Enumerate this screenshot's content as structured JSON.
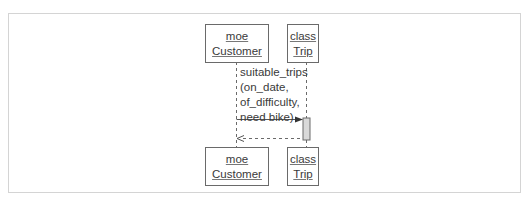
{
  "diagram": {
    "type": "sequence",
    "participants": [
      {
        "id": "customer",
        "instance": "moe",
        "class": "Customer"
      },
      {
        "id": "trip",
        "instance": "class",
        "class": "Trip"
      }
    ],
    "messages": [
      {
        "from": "customer",
        "to": "trip",
        "kind": "call",
        "label_lines": [
          "suitable_trips",
          "(on_date,",
          "of_difficulty,",
          "need bike)"
        ]
      },
      {
        "from": "trip",
        "to": "customer",
        "kind": "return",
        "label_lines": []
      }
    ],
    "colors": {
      "line": "#6a6a6a",
      "activation_fill": "#d9d9d9",
      "frame": "#d4d4d4"
    }
  }
}
